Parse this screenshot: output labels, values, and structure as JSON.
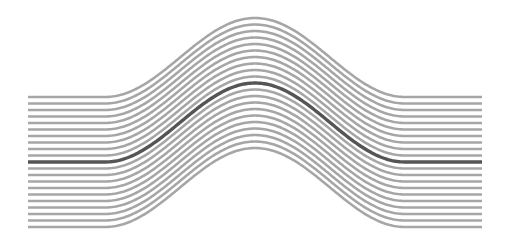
{
  "figure": {
    "line_count": 21,
    "highlight_index": 10,
    "x_start": 28,
    "x_end": 482,
    "peak_x": 255,
    "baseline_top_y": 97,
    "line_spacing": 6.5,
    "peak_rise": 79,
    "bump_half_width": 150,
    "colors": {
      "background": "#ffffff",
      "line": "#a6a6a6",
      "highlight": "#555555"
    },
    "stroke_widths": {
      "line": 2.6,
      "highlight": 3.4
    }
  }
}
